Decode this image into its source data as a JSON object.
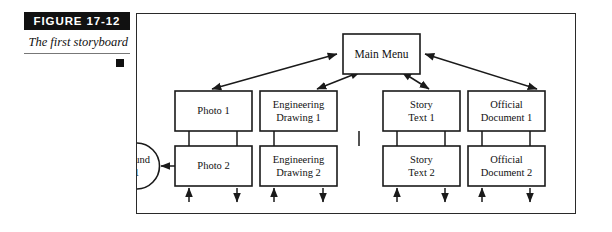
{
  "figure": {
    "label": "FIGURE  17-12",
    "caption": "The first storyboard",
    "bullet_icon": "black-square-bullet"
  },
  "diagram": {
    "type": "storyboard-flowchart",
    "root": {
      "id": "main-menu",
      "label": "Main Menu"
    },
    "columns": [
      {
        "top": {
          "id": "photo-1",
          "label_line1": "Photo 1",
          "label_line2": ""
        },
        "bottom": {
          "id": "photo-2",
          "label_line1": "Photo 2",
          "label_line2": ""
        }
      },
      {
        "top": {
          "id": "engineering-drawing-1",
          "label_line1": "Engineering",
          "label_line2": "Drawing 1"
        },
        "bottom": {
          "id": "engineering-drawing-2",
          "label_line1": "Engineering",
          "label_line2": "Drawing 2"
        }
      },
      {
        "top": {
          "id": "story-text-1",
          "label_line1": "Story",
          "label_line2": "Text 1"
        },
        "bottom": {
          "id": "story-text-2",
          "label_line1": "Story",
          "label_line2": "Text 2"
        }
      },
      {
        "top": {
          "id": "official-document-1",
          "label_line1": "Official",
          "label_line2": "Document 1"
        },
        "bottom": {
          "id": "official-document-2",
          "label_line1": "Official",
          "label_line2": "Document 2"
        }
      }
    ],
    "side_node": {
      "id": "sound-1",
      "label_line1": "Sound",
      "label_line2": "1"
    },
    "colors": {
      "stroke": "#1a1a1a",
      "fill": "#ffffff",
      "label_bar": "#111111",
      "label_text": "#ffffff"
    }
  }
}
